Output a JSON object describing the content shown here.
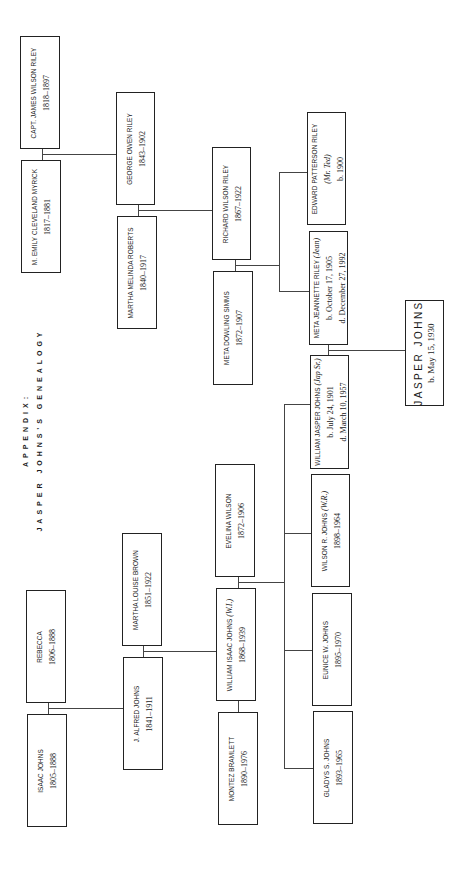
{
  "title": {
    "line1": "APPENDIX:",
    "line2": "JASPER JOHNS'S GENEALOGY"
  },
  "people": {
    "james_wilson_riley": {
      "name": "CAPT. JAMES WILSON RILEY",
      "dates": "1818–1897"
    },
    "emily_myrick": {
      "name": "M. EMILY CLEVELAND MYRICK",
      "dates": "1817–1881"
    },
    "george_owen_riley": {
      "name": "GEORGE OWEN RILEY",
      "dates": "1843–1902"
    },
    "martha_roberts": {
      "name": "MARTHA MELINDA ROBERTS",
      "dates": "1840–1917"
    },
    "richard_wilson_riley": {
      "name": "RICHARD WILSON RILEY",
      "dates": "1867–1922"
    },
    "meta_simms": {
      "name": "META DOWLING SIMMS",
      "dates": "1872–1907"
    },
    "edward_riley": {
      "name": "EDWARD PATTERSON RILEY",
      "nickname": "(Mr. Ted)",
      "dates": "b. 1900"
    },
    "meta_jeannette_riley": {
      "name": "META JEANNETTE RILEY",
      "nickname": "(Jean)",
      "born": "b. October 17, 1905",
      "died": "d. December 27, 1992"
    },
    "jasper_johns": {
      "name": "JASPER JOHNS",
      "born": "b. May 15, 1930"
    },
    "william_jasper_johns": {
      "name": "WILLIAM JASPER JOHNS",
      "nickname": "(Jap Sr.)",
      "born": "b. July 24, 1901",
      "died": "d. March 10, 1957"
    },
    "wilson_johns": {
      "name": "WILSON R. JOHNS",
      "nickname": "(W.R.)",
      "dates": "1898–1964"
    },
    "eunice_johns": {
      "name": "EUNICE W. JOHNS",
      "dates": "1895–1970"
    },
    "gladys_johns": {
      "name": "GLADYS S. JOHNS",
      "dates": "1893–1965"
    },
    "evelina_wilson": {
      "name": "EVELINA WILSON",
      "dates": "1872–1906"
    },
    "william_isaac_johns": {
      "name": "WILLIAM ISAAC JOHNS",
      "nickname": "(W.I.)",
      "dates": "1868–1939"
    },
    "montez_bramlett": {
      "name": "MONTEZ BRAMLETT",
      "dates": "1890–1976"
    },
    "martha_brown": {
      "name": "MARTHA LOUISE BROWN",
      "dates": "1851–1922"
    },
    "alfred_johns": {
      "name": "J. ALFRED JOHNS",
      "dates": "1841–1911"
    },
    "rebecca": {
      "name": "REBECCA",
      "dates": "1806–1888"
    },
    "isaac_johns": {
      "name": "ISAAC JOHNS",
      "dates": "1805–1888"
    }
  }
}
